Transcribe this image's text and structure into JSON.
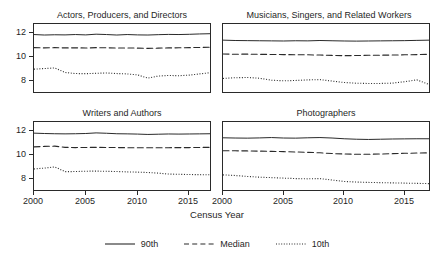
{
  "chart_data": {
    "type": "line",
    "title": "",
    "xlabel": "Census Year",
    "ylabel": "",
    "xlim": [
      2000,
      2017
    ],
    "ylim": [
      7.0,
      12.7
    ],
    "xticks": [
      2000,
      2005,
      2010,
      2015
    ],
    "yticks": [
      8,
      10,
      12
    ],
    "grid": false,
    "legend_position": "bottom",
    "legend": [
      {
        "name": "90th",
        "style": "solid"
      },
      {
        "name": "Median",
        "style": "dashed"
      },
      {
        "name": "10th",
        "style": "dotted"
      }
    ],
    "x": [
      2000,
      2001,
      2002,
      2003,
      2004,
      2005,
      2006,
      2007,
      2008,
      2009,
      2010,
      2011,
      2012,
      2013,
      2014,
      2015,
      2016,
      2017
    ],
    "panels": [
      {
        "title": "Actors, Producers, and Directors",
        "position": "top-left",
        "show_yaxis": true,
        "show_xaxis": false,
        "series": [
          {
            "name": "90th",
            "style": "solid",
            "values": [
              11.9,
              11.86,
              11.88,
              11.87,
              11.9,
              11.87,
              11.93,
              11.9,
              11.86,
              11.9,
              11.87,
              11.86,
              11.89,
              11.91,
              11.9,
              11.92,
              11.95,
              11.97
            ]
          },
          {
            "name": "Median",
            "style": "dashed",
            "values": [
              10.8,
              10.78,
              10.8,
              10.78,
              10.79,
              10.77,
              10.8,
              10.79,
              10.77,
              10.78,
              10.76,
              10.74,
              10.76,
              10.78,
              10.79,
              10.8,
              10.82,
              10.84
            ]
          },
          {
            "name": "10th",
            "style": "dotted",
            "values": [
              9.0,
              9.05,
              9.1,
              8.72,
              8.63,
              8.62,
              8.65,
              8.68,
              8.63,
              8.6,
              8.52,
              8.25,
              8.42,
              8.47,
              8.45,
              8.5,
              8.6,
              8.7
            ]
          }
        ]
      },
      {
        "title": "Musicians, Singers, and Related Workers",
        "position": "top-right",
        "show_yaxis": false,
        "show_xaxis": false,
        "series": [
          {
            "name": "90th",
            "style": "solid",
            "values": [
              11.43,
              11.4,
              11.39,
              11.38,
              11.37,
              11.36,
              11.38,
              11.37,
              11.4,
              11.38,
              11.36,
              11.35,
              11.36,
              11.37,
              11.38,
              11.39,
              11.41,
              11.43
            ]
          },
          {
            "name": "Median",
            "style": "dashed",
            "values": [
              10.27,
              10.25,
              10.26,
              10.24,
              10.23,
              10.22,
              10.21,
              10.2,
              10.18,
              10.15,
              10.13,
              10.14,
              10.16,
              10.17,
              10.18,
              10.2,
              10.22,
              10.24
            ]
          },
          {
            "name": "10th",
            "style": "dotted",
            "values": [
              8.22,
              8.28,
              8.3,
              8.24,
              8.08,
              8.02,
              8.05,
              8.1,
              8.12,
              8.0,
              7.88,
              7.82,
              7.8,
              7.8,
              7.83,
              7.95,
              8.1,
              7.72
            ]
          }
        ]
      },
      {
        "title": "Writers and Authors",
        "position": "bottom-left",
        "show_yaxis": true,
        "show_xaxis": true,
        "series": [
          {
            "name": "90th",
            "style": "solid",
            "values": [
              11.85,
              11.82,
              11.8,
              11.79,
              11.8,
              11.82,
              11.87,
              11.84,
              11.8,
              11.79,
              11.77,
              11.74,
              11.76,
              11.78,
              11.77,
              11.78,
              11.79,
              11.8
            ]
          },
          {
            "name": "Median",
            "style": "dashed",
            "values": [
              10.7,
              10.74,
              10.76,
              10.66,
              10.64,
              10.65,
              10.66,
              10.65,
              10.64,
              10.63,
              10.62,
              10.62,
              10.63,
              10.63,
              10.64,
              10.64,
              10.65,
              10.66
            ]
          },
          {
            "name": "10th",
            "style": "dotted",
            "values": [
              8.85,
              8.92,
              9.02,
              8.62,
              8.63,
              8.66,
              8.67,
              8.65,
              8.63,
              8.6,
              8.58,
              8.55,
              8.5,
              8.42,
              8.4,
              8.38,
              8.37,
              8.36
            ]
          }
        ]
      },
      {
        "title": "Photographers",
        "position": "bottom-right",
        "show_yaxis": false,
        "show_xaxis": true,
        "series": [
          {
            "name": "90th",
            "style": "solid",
            "values": [
              11.46,
              11.44,
              11.43,
              11.45,
              11.48,
              11.44,
              11.43,
              11.46,
              11.48,
              11.44,
              11.38,
              11.34,
              11.32,
              11.34,
              11.36,
              11.37,
              11.38,
              11.38
            ]
          },
          {
            "name": "Median",
            "style": "dashed",
            "values": [
              10.38,
              10.37,
              10.36,
              10.34,
              10.32,
              10.3,
              10.27,
              10.24,
              10.2,
              10.14,
              10.1,
              10.08,
              10.08,
              10.1,
              10.13,
              10.16,
              10.18,
              10.2
            ]
          },
          {
            "name": "10th",
            "style": "dotted",
            "values": [
              8.35,
              8.3,
              8.22,
              8.16,
              8.12,
              8.08,
              8.04,
              8.02,
              8.04,
              7.92,
              7.8,
              7.75,
              7.72,
              7.7,
              7.68,
              7.66,
              7.64,
              7.62
            ]
          }
        ]
      }
    ]
  },
  "axis": {
    "xlabel": "Census Year",
    "xticks": [
      "2000",
      "2005",
      "2010",
      "2015"
    ],
    "yticks": [
      "12",
      "10",
      "8"
    ]
  },
  "legend": {
    "items": [
      {
        "label": "90th",
        "style": "solid"
      },
      {
        "label": "Median",
        "style": "dashed"
      },
      {
        "label": "10th",
        "style": "dotted"
      }
    ]
  },
  "panel_titles": {
    "top_left": "Actors, Producers, and Directors",
    "top_right": "Musicians, Singers, and Related Workers",
    "bottom_left": "Writers and Authors",
    "bottom_right": "Photographers"
  },
  "colors": {
    "line": "#2a2a2a",
    "axis": "#2a2a2a",
    "background": "#ffffff",
    "text": "#1f1f1f"
  }
}
